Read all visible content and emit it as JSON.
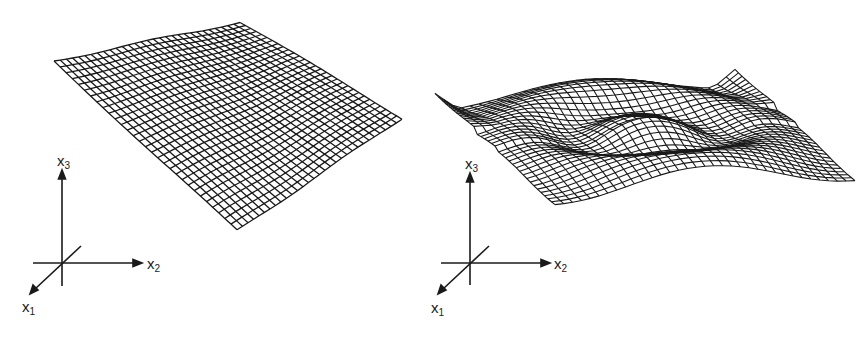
{
  "figure": {
    "panels": [
      {
        "id": "left",
        "description": "nearly planar tilted wireframe surface",
        "axes": {
          "x1": {
            "name": "x",
            "sub": "1"
          },
          "x2": {
            "name": "x",
            "sub": "2"
          },
          "x3": {
            "name": "x",
            "sub": "3"
          }
        }
      },
      {
        "id": "right",
        "description": "undulating wireframe surface with central bump and raised rim",
        "axes": {
          "x1": {
            "name": "x",
            "sub": "1"
          },
          "x2": {
            "name": "x",
            "sub": "2"
          },
          "x3": {
            "name": "x",
            "sub": "3"
          }
        }
      }
    ],
    "colors": {
      "ink": "#1a1a1a",
      "background": "#ffffff"
    }
  }
}
